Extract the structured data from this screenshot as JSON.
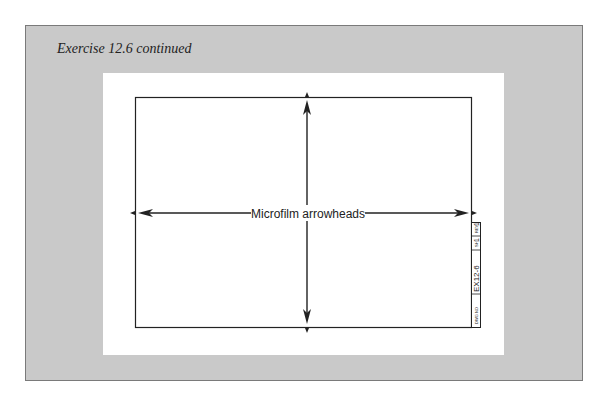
{
  "caption": "Exercise 12.6 continued",
  "drawing": {
    "center_label": "Microfilm arrowheads",
    "title_block": {
      "dwg_no_label": "DWG NO",
      "dwg_no_value": "EX12-6",
      "sheet_label": "SH",
      "sheet_value": "1",
      "rev_label": "REV",
      "rev_value": "1"
    }
  },
  "colors": {
    "panel": "#c9c9c9",
    "sheet": "#ffffff",
    "line": "#222222"
  }
}
